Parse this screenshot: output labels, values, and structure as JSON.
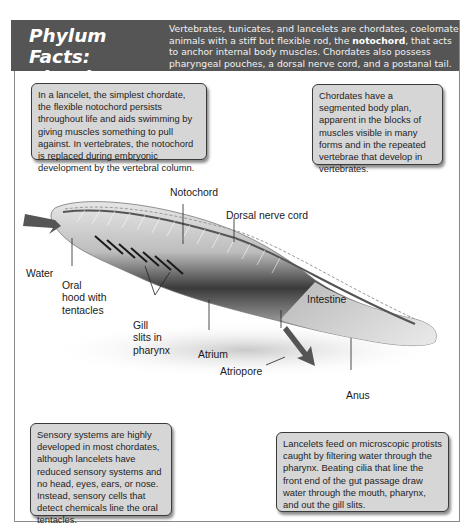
{
  "header": {
    "title_line1": "Phylum Facts:",
    "title_line2": "Chordata",
    "intro_part1": "Vertebrates, tunicates, and lancelets are chordates, coelomate animals with a stiff but flexible rod, the ",
    "intro_bold": "notochord",
    "intro_part2": ", that acts to anchor internal body muscles. Chordates also possess pharyngeal pouches, a dorsal nerve cord, and a postanal tail."
  },
  "callouts": {
    "notochord": "In a lancelet, the simplest chordate, the flexible notochord persists throughout life and aids swimming by giving muscles something to pull against. In vertebrates, the notochord is replaced during embryonic development by the vertebral column.",
    "segmented": "Chordates have a segmented body plan, apparent in the blocks of muscles visible in many forms and in the repeated vertebrae that develop in vertebrates.",
    "sensory": "Sensory systems are highly developed in most chordates, although lancelets have reduced sensory systems and no head, eyes, ears, or nose. Instead, sensory cells that detect chemicals line the oral tentacles.",
    "feeding": "Lancelets feed on microscopic protists caught by filtering water through the pharynx. Beating cilia that line the front end of the gut passage draw water through the mouth, pharynx, and out the gill slits."
  },
  "diagram": {
    "subject": "lancelet",
    "labels": {
      "notochord": "Notochord",
      "dorsal_nerve_cord": "Dorsal nerve cord",
      "water": "Water",
      "oral_hood_1": "Oral",
      "oral_hood_2": "hood with",
      "oral_hood_3": "tentacles",
      "gill_1": "Gill",
      "gill_2": "slits in",
      "gill_3": "pharynx",
      "intestine": "Intestine",
      "atrium": "Atrium",
      "atriopore": "Atriopore",
      "anus": "Anus"
    }
  }
}
